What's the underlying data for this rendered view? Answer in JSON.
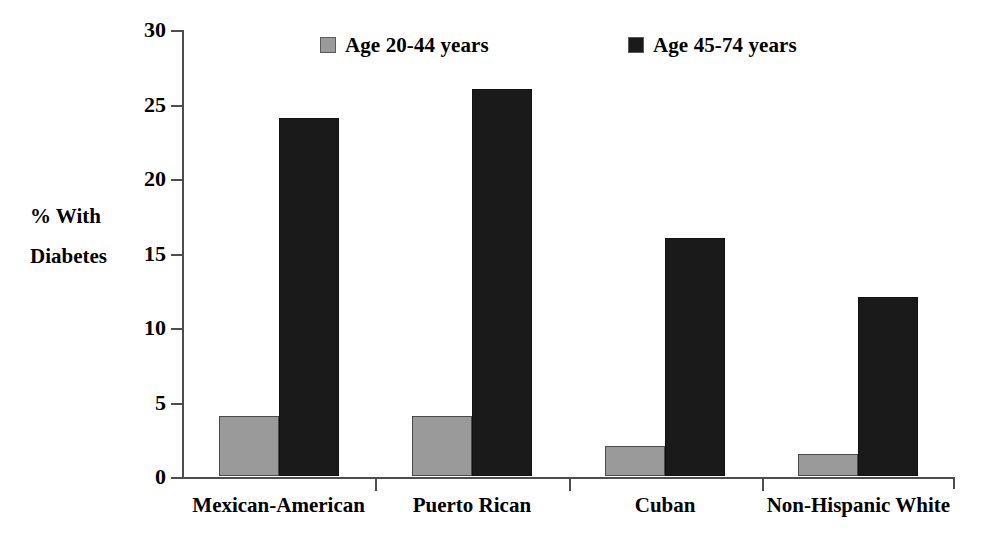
{
  "chart_data": {
    "type": "bar",
    "title": "",
    "subtitle": "",
    "xlabel": "",
    "ylabel": "% With Diabetes",
    "ylabel_lines": [
      "% With",
      "Diabetes"
    ],
    "categories": [
      "Mexican-American",
      "Puerto Rican",
      "Cuban",
      "Non-Hispanic White"
    ],
    "series": [
      {
        "name": "Age 20-44 years",
        "color": "#9a9a9a",
        "values": [
          4,
          4,
          2,
          1.5
        ]
      },
      {
        "name": "Age 45-74 years",
        "color": "#1a1a1a",
        "values": [
          24,
          26,
          16,
          12
        ]
      }
    ],
    "ylim": [
      0,
      30
    ],
    "yticks": [
      0,
      5,
      10,
      15,
      20,
      25,
      30
    ],
    "ytick_labels": [
      "0",
      "5",
      "10",
      "15",
      "20",
      "25",
      "30"
    ],
    "grid": false,
    "legend_position": "top",
    "legend": [
      {
        "label": "Age 20-44 years",
        "color": "#9a9a9a"
      },
      {
        "label": "Age 45-74 years",
        "color": "#1a1a1a"
      }
    ],
    "axis_color": "#4d4d4d",
    "background_color": "#ffffff"
  }
}
